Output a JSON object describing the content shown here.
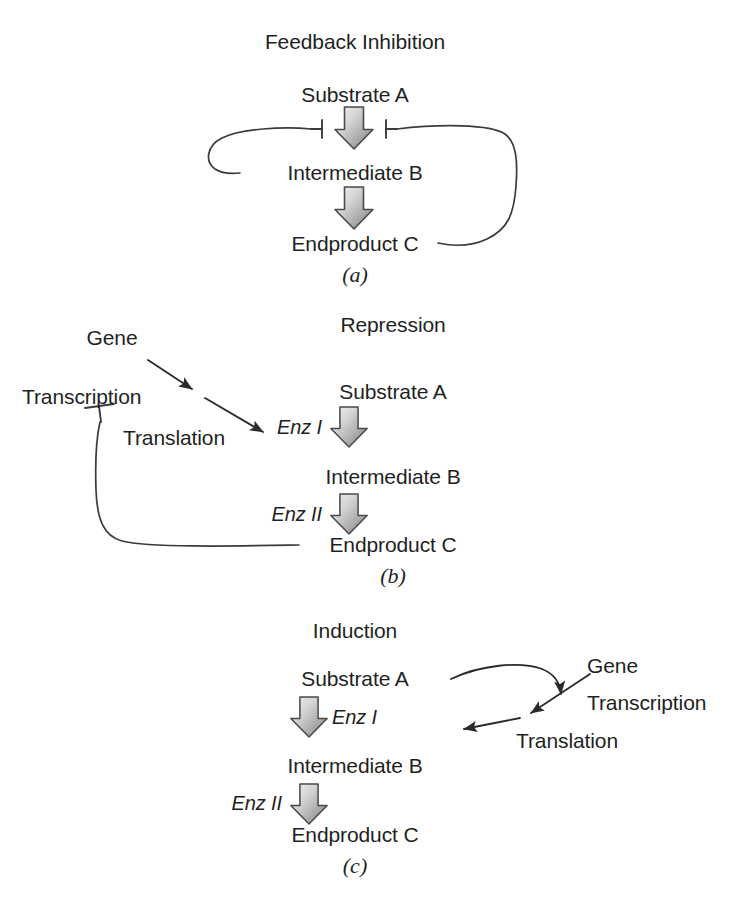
{
  "figure": {
    "background_color": "#ffffff",
    "line_color": "#3b3b3b",
    "text_color": "#1f1f1f",
    "arrow_fill_light": "#e8e8e8",
    "arrow_fill_dark": "#8d8d8d"
  },
  "panels": [
    {
      "id": "a",
      "title": "Feedback Inhibition",
      "panel_label": "(a)",
      "pathway": [
        "Substrate A",
        "Intermediate B",
        "Endproduct C"
      ],
      "arrow_icons": [
        "fat-down-arrow",
        "fat-down-arrow"
      ],
      "inhibition_marks": [
        "inhibition-bar-left",
        "inhibition-bar-right"
      ],
      "feedback_loops": [
        "intermediate-b-to-step-1",
        "endproduct-c-to-step-1"
      ]
    },
    {
      "id": "b",
      "title": "Repression",
      "panel_label": "(b)",
      "pathway": [
        "Substrate A",
        "Intermediate B",
        "Endproduct C"
      ],
      "enzymes": [
        "Enz I",
        "Enz II"
      ],
      "gene": "Gene",
      "transcription": "Transcription",
      "translation": "Translation",
      "arrow_icons": [
        "fat-down-arrow",
        "fat-down-arrow"
      ],
      "inhibition_marks": [
        "inhibition-bar-transcription"
      ],
      "feedback_loops": [
        "endproduct-c-to-transcription"
      ]
    },
    {
      "id": "c",
      "title": "Induction",
      "panel_label": "(c)",
      "pathway": [
        "Substrate A",
        "Intermediate B",
        "Endproduct C"
      ],
      "enzymes": [
        "Enz I",
        "Enz II"
      ],
      "gene": "Gene",
      "transcription": "Transcription",
      "translation": "Translation",
      "arrow_icons": [
        "fat-down-arrow",
        "fat-down-arrow"
      ],
      "activation_loops": [
        "substrate-a-to-gene",
        "gene-to-translation",
        "translation-to-enz-1"
      ]
    }
  ]
}
